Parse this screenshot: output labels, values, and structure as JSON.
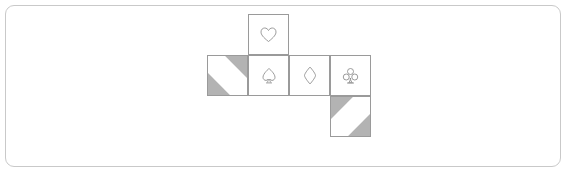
{
  "canvas": {
    "width": 568,
    "height": 174,
    "background": "#ffffff",
    "frame_border_color": "#c9c9c9",
    "frame_radius": 9
  },
  "diagram": {
    "name": "cube-net",
    "cell_size": 41,
    "line_color": "#9a9a9a",
    "shade_color": "#b3b3b3",
    "glyph_color": "#8a8a8a",
    "origin": {
      "x": 207,
      "y": 14
    },
    "cells": [
      {
        "id": "cell-heart",
        "name": "net-face-heart",
        "col": 1,
        "row": 0,
        "x": 248,
        "y": 14,
        "symbol": "heart",
        "symbol_char": "♡",
        "shaded": false,
        "shade_corners": []
      },
      {
        "id": "cell-blank-left",
        "name": "net-face-blank-left",
        "col": 0,
        "row": 1,
        "x": 207,
        "y": 55,
        "symbol": "none",
        "symbol_char": "",
        "shaded": true,
        "shade_corners": [
          "top-right",
          "bottom-left"
        ]
      },
      {
        "id": "cell-spade",
        "name": "net-face-spade",
        "col": 1,
        "row": 1,
        "x": 248,
        "y": 55,
        "symbol": "spade",
        "symbol_char": "♠",
        "shaded": false,
        "shade_corners": []
      },
      {
        "id": "cell-diamond",
        "name": "net-face-diamond",
        "col": 2,
        "row": 1,
        "x": 289,
        "y": 55,
        "symbol": "diamond",
        "symbol_char": "♢",
        "shaded": false,
        "shade_corners": []
      },
      {
        "id": "cell-club",
        "name": "net-face-club",
        "col": 3,
        "row": 1,
        "x": 330,
        "y": 55,
        "symbol": "club",
        "symbol_char": "♣",
        "shaded": false,
        "shade_corners": []
      },
      {
        "id": "cell-blank-bottom",
        "name": "net-face-blank-bottom",
        "col": 3,
        "row": 2,
        "x": 330,
        "y": 96,
        "symbol": "none",
        "symbol_char": "",
        "shaded": true,
        "shade_corners": [
          "top-left",
          "bottom-right"
        ]
      }
    ]
  }
}
